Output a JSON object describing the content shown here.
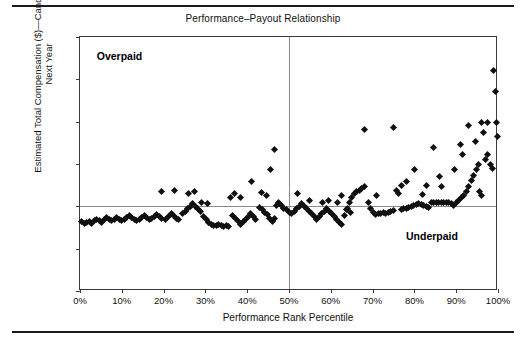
{
  "chart_data": {
    "type": "scatter",
    "title": "Performance–Payout Relationship",
    "xlabel": "Performance Rank Percentile",
    "ylabel_line1": "Estimated Total Compensation ($)—Candidate Plan",
    "ylabel_line2": "Next Year",
    "xlim": [
      0,
      100
    ],
    "ylim": [
      0,
      150000
    ],
    "grid": false,
    "legend": null,
    "xticks": [
      0,
      10,
      20,
      30,
      40,
      50,
      60,
      70,
      80,
      90,
      100
    ],
    "xtick_labels": [
      "0%",
      "10%",
      "20%",
      "30%",
      "40%",
      "50%",
      "60%",
      "70%",
      "80%",
      "90%",
      "100%"
    ],
    "yticks": [
      0,
      25000,
      50000,
      75000,
      100000,
      125000,
      150000
    ],
    "ytick_labels": [
      "0",
      "25,000",
      "50,000",
      "75,000",
      "100,000",
      "125,000",
      "150,000"
    ],
    "reference_lines": {
      "vertical_x": 50,
      "horizontal_y": 50000,
      "color": "#8a8a8a"
    },
    "annotations": [
      {
        "text": "Overpaid",
        "x": 4,
        "y": 138000,
        "bold": true
      },
      {
        "text": "Underpaid",
        "x": 78,
        "y": 32000,
        "bold": true
      }
    ],
    "marker": {
      "shape": "diamond",
      "color": "#101010",
      "size": 5
    },
    "points": [
      [
        0.3,
        41000
      ],
      [
        1.0,
        40000
      ],
      [
        1.6,
        40500
      ],
      [
        2.2,
        41000
      ],
      [
        2.8,
        40000
      ],
      [
        3.4,
        41500
      ],
      [
        4.0,
        42500
      ],
      [
        4.6,
        41500
      ],
      [
        5.2,
        40500
      ],
      [
        5.8,
        42000
      ],
      [
        6.4,
        43500
      ],
      [
        7.0,
        42500
      ],
      [
        7.6,
        41500
      ],
      [
        8.2,
        42500
      ],
      [
        8.8,
        43500
      ],
      [
        9.4,
        42500
      ],
      [
        10.0,
        41500
      ],
      [
        10.6,
        42500
      ],
      [
        11.2,
        43500
      ],
      [
        11.8,
        44500
      ],
      [
        12.4,
        43500
      ],
      [
        13.0,
        42500
      ],
      [
        13.6,
        41500
      ],
      [
        14.2,
        42500
      ],
      [
        14.8,
        43500
      ],
      [
        15.4,
        44500
      ],
      [
        16.0,
        43500
      ],
      [
        16.6,
        42500
      ],
      [
        17.2,
        43000
      ],
      [
        17.8,
        44000
      ],
      [
        18.4,
        45000
      ],
      [
        19.0,
        44000
      ],
      [
        19.6,
        43000
      ],
      [
        20.5,
        42500
      ],
      [
        21.2,
        44000
      ],
      [
        21.8,
        45500
      ],
      [
        22.4,
        44500
      ],
      [
        23.0,
        43000
      ],
      [
        23.6,
        42000
      ],
      [
        19.5,
        58500
      ],
      [
        22.5,
        59500
      ],
      [
        24.5,
        45500
      ],
      [
        25.2,
        47000
      ],
      [
        25.8,
        48500
      ],
      [
        26.4,
        50000
      ],
      [
        27.0,
        51500
      ],
      [
        27.6,
        50000
      ],
      [
        28.2,
        48500
      ],
      [
        28.8,
        47000
      ],
      [
        26.0,
        57500
      ],
      [
        27.5,
        58500
      ],
      [
        29.5,
        44000
      ],
      [
        30.2,
        42000
      ],
      [
        30.8,
        40500
      ],
      [
        31.4,
        39500
      ],
      [
        32.0,
        38500
      ],
      [
        32.6,
        38500
      ],
      [
        33.2,
        39000
      ],
      [
        33.8,
        38500
      ],
      [
        34.4,
        38000
      ],
      [
        35.0,
        38500
      ],
      [
        35.6,
        38000
      ],
      [
        29.0,
        52500
      ],
      [
        30.5,
        51500
      ],
      [
        36.5,
        44500
      ],
      [
        37.2,
        43000
      ],
      [
        37.8,
        41000
      ],
      [
        38.4,
        39500
      ],
      [
        39.0,
        41000
      ],
      [
        39.6,
        42500
      ],
      [
        40.2,
        44000
      ],
      [
        40.8,
        45500
      ],
      [
        41.4,
        44000
      ],
      [
        42.0,
        42500
      ],
      [
        36.0,
        55500
      ],
      [
        37.0,
        57500
      ],
      [
        38.5,
        55000
      ],
      [
        41.0,
        64500
      ],
      [
        43.0,
        49500
      ],
      [
        43.6,
        48000
      ],
      [
        44.2,
        46500
      ],
      [
        44.8,
        45000
      ],
      [
        45.4,
        43000
      ],
      [
        46.0,
        41000
      ],
      [
        46.6,
        43000
      ],
      [
        43.5,
        58000
      ],
      [
        44.5,
        56500
      ],
      [
        45.5,
        71500
      ],
      [
        47.0,
        50500
      ],
      [
        47.6,
        52000
      ],
      [
        48.2,
        50500
      ],
      [
        48.8,
        49000
      ],
      [
        46.5,
        83500
      ],
      [
        49.4,
        48000
      ],
      [
        50.0,
        46500
      ],
      [
        50.6,
        45500
      ],
      [
        51.2,
        47000
      ],
      [
        51.8,
        48500
      ],
      [
        52.4,
        50000
      ],
      [
        53.0,
        51500
      ],
      [
        52.0,
        57500
      ],
      [
        53.6,
        50000
      ],
      [
        54.2,
        48500
      ],
      [
        54.8,
        47000
      ],
      [
        55.4,
        45500
      ],
      [
        56.0,
        44000
      ],
      [
        56.6,
        42500
      ],
      [
        55.0,
        53500
      ],
      [
        57.2,
        44000
      ],
      [
        57.8,
        45500
      ],
      [
        58.4,
        47000
      ],
      [
        59.0,
        48500
      ],
      [
        59.6,
        47000
      ],
      [
        60.2,
        45500
      ],
      [
        60.8,
        44000
      ],
      [
        58.0,
        52500
      ],
      [
        59.5,
        53500
      ],
      [
        61.4,
        42000
      ],
      [
        62.0,
        40500
      ],
      [
        62.6,
        39500
      ],
      [
        61.5,
        52500
      ],
      [
        62.5,
        56500
      ],
      [
        63.2,
        44500
      ],
      [
        63.8,
        48000
      ],
      [
        64.4,
        52000
      ],
      [
        65.0,
        55500
      ],
      [
        65.6,
        57500
      ],
      [
        66.2,
        58500
      ],
      [
        66.8,
        59500
      ],
      [
        64.0,
        49000
      ],
      [
        64.6,
        46500
      ],
      [
        67.4,
        60500
      ],
      [
        68.0,
        61500
      ],
      [
        68.0,
        95500
      ],
      [
        69.0,
        52000
      ],
      [
        69.6,
        49000
      ],
      [
        70.2,
        46500
      ],
      [
        70.8,
        45000
      ],
      [
        71.4,
        45500
      ],
      [
        72.0,
        46000
      ],
      [
        72.6,
        46500
      ],
      [
        71.0,
        56500
      ],
      [
        73.2,
        46000
      ],
      [
        73.8,
        46500
      ],
      [
        74.4,
        47000
      ],
      [
        75.0,
        47500
      ],
      [
        75.0,
        96500
      ],
      [
        75.6,
        59500
      ],
      [
        76.2,
        57500
      ],
      [
        76.8,
        48000
      ],
      [
        77.4,
        48500
      ],
      [
        78.0,
        49000
      ],
      [
        78.6,
        49500
      ],
      [
        77.0,
        62500
      ],
      [
        78.0,
        64500
      ],
      [
        79.2,
        50000
      ],
      [
        79.8,
        50500
      ],
      [
        80.4,
        51000
      ],
      [
        81.0,
        51500
      ],
      [
        80.0,
        71500
      ],
      [
        81.6,
        51000
      ],
      [
        82.2,
        50500
      ],
      [
        82.8,
        50000
      ],
      [
        83.4,
        49500
      ],
      [
        82.0,
        57000
      ],
      [
        83.0,
        62500
      ],
      [
        84.0,
        52500
      ],
      [
        84.6,
        52500
      ],
      [
        85.2,
        52500
      ],
      [
        85.8,
        52500
      ],
      [
        84.5,
        84500
      ],
      [
        86.4,
        52500
      ],
      [
        87.0,
        52500
      ],
      [
        87.6,
        52500
      ],
      [
        88.2,
        52500
      ],
      [
        86.0,
        67500
      ],
      [
        86.5,
        61500
      ],
      [
        88.8,
        51500
      ],
      [
        89.4,
        50500
      ],
      [
        90.0,
        52500
      ],
      [
        90.6,
        53500
      ],
      [
        89.5,
        71500
      ],
      [
        91.2,
        55000
      ],
      [
        91.8,
        56500
      ],
      [
        91.0,
        86500
      ],
      [
        91.5,
        80500
      ],
      [
        92.4,
        58500
      ],
      [
        93.0,
        61500
      ],
      [
        93.0,
        97500
      ],
      [
        93.6,
        65500
      ],
      [
        94.2,
        68500
      ],
      [
        94.5,
        88500
      ],
      [
        94.8,
        71500
      ],
      [
        95.4,
        74500
      ],
      [
        95.5,
        58500
      ],
      [
        96.0,
        56500
      ],
      [
        96.0,
        99500
      ],
      [
        96.5,
        93500
      ],
      [
        97.0,
        77500
      ],
      [
        97.6,
        80500
      ],
      [
        97.5,
        99500
      ],
      [
        98.2,
        74500
      ],
      [
        98.8,
        72500
      ],
      [
        99.0,
        130000
      ],
      [
        99.3,
        118000
      ],
      [
        99.8,
        91500
      ],
      [
        99.6,
        99500
      ]
    ]
  }
}
